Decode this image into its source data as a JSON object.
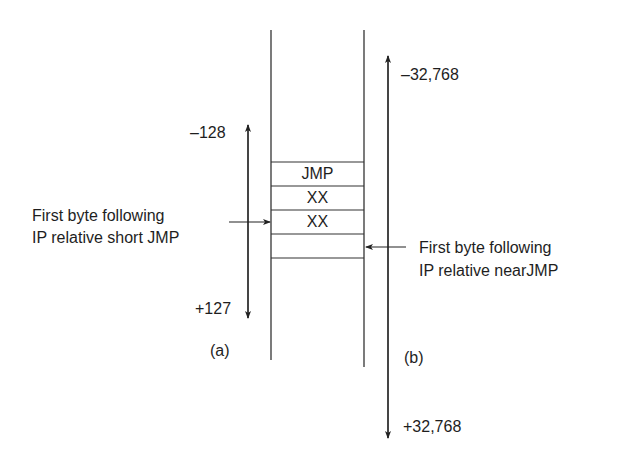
{
  "diagram": {
    "type": "memory-layout-jump-range",
    "memory_cells": [
      {
        "label": "JMP"
      },
      {
        "label": "XX"
      },
      {
        "label": "XX"
      },
      {
        "label": ""
      }
    ],
    "short_jump": {
      "panel_label": "(a)",
      "range_top": "–128",
      "range_bottom": "+127",
      "pointer_label_line1": "First byte following",
      "pointer_label_line2": "IP relative short JMP"
    },
    "near_jump": {
      "panel_label": "(b)",
      "range_top": "–32,768",
      "range_bottom": "+32,768",
      "pointer_label_line1": "First byte following",
      "pointer_label_line2": "IP relative nearJMP"
    },
    "colors": {
      "line": "#333333",
      "text": "#1e1e1e",
      "background": "#ffffff"
    }
  }
}
